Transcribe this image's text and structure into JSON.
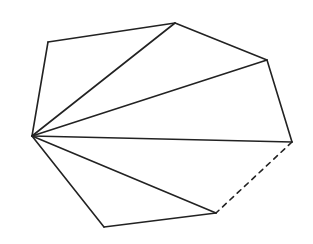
{
  "diagram": {
    "title": "",
    "background": "#ffffff",
    "stroke_color": "#222222",
    "shape": "heptagon",
    "vertices": {
      "A": [
        32,
        136
      ],
      "B": [
        48,
        42
      ],
      "C": [
        175,
        23
      ],
      "D": [
        267,
        60
      ],
      "E": [
        292,
        142
      ],
      "F": [
        216,
        213
      ],
      "G": [
        104,
        227
      ]
    },
    "edges": [
      {
        "from": "A",
        "to": "B",
        "style": "solid"
      },
      {
        "from": "B",
        "to": "C",
        "style": "solid"
      },
      {
        "from": "C",
        "to": "D",
        "style": "solid"
      },
      {
        "from": "D",
        "to": "E",
        "style": "solid"
      },
      {
        "from": "E",
        "to": "F",
        "style": "dashed"
      },
      {
        "from": "F",
        "to": "G",
        "style": "solid"
      },
      {
        "from": "G",
        "to": "A",
        "style": "solid"
      }
    ],
    "diagonals": [
      {
        "from": "A",
        "to": "C",
        "style": "solid"
      },
      {
        "from": "A",
        "to": "D",
        "style": "solid"
      },
      {
        "from": "A",
        "to": "E",
        "style": "solid"
      },
      {
        "from": "A",
        "to": "F",
        "style": "solid"
      }
    ]
  }
}
